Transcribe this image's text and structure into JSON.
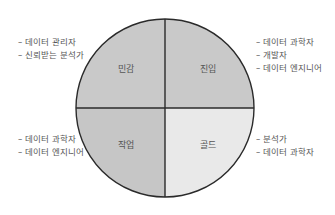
{
  "diagram": {
    "center": {
      "x": 165,
      "y": 108
    },
    "radius": 89,
    "colors": {
      "outline": "#2a2a2a",
      "top_left": "#c9c9c9",
      "top_right": "#c9c9c9",
      "bottom_left": "#c6c6c6",
      "bottom_right": "#e9e9e9"
    },
    "quadrants": {
      "top_left": {
        "label": "민감",
        "roles": [
          "데이터 관리자",
          "신뢰받는 분석가"
        ]
      },
      "top_right": {
        "label": "진입",
        "roles": [
          "데이터 과학자",
          "개발자",
          "데이터 엔지니어"
        ]
      },
      "bottom_left": {
        "label": "작업",
        "roles": [
          "데이터 과학자",
          "데이터 엔지니어"
        ]
      },
      "bottom_right": {
        "label": "골드",
        "roles": [
          "분석가",
          "데이터 과학자"
        ]
      }
    }
  }
}
